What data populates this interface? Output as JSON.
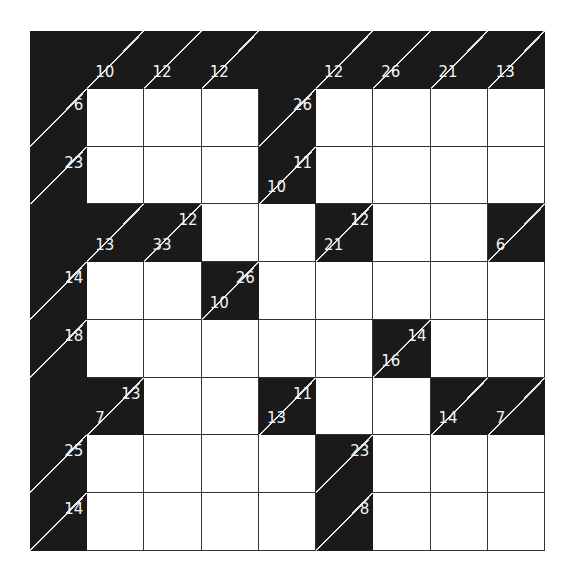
{
  "puzzle": {
    "type": "kakuro",
    "rows": 9,
    "cols": 9,
    "colors": {
      "black": "#1a1a1a",
      "white": "#ffffff",
      "clue_text": "#f2f2f2",
      "grid_line": "#333333"
    },
    "cells": [
      [
        {
          "t": "b"
        },
        {
          "t": "c",
          "d": "10"
        },
        {
          "t": "c",
          "d": "12"
        },
        {
          "t": "c",
          "d": "12"
        },
        {
          "t": "b"
        },
        {
          "t": "c",
          "d": "12"
        },
        {
          "t": "c",
          "d": "26"
        },
        {
          "t": "c",
          "d": "21"
        },
        {
          "t": "c",
          "d": "13"
        }
      ],
      [
        {
          "t": "c",
          "r": "6"
        },
        {
          "t": "w"
        },
        {
          "t": "w"
        },
        {
          "t": "w"
        },
        {
          "t": "c",
          "r": "26"
        },
        {
          "t": "w"
        },
        {
          "t": "w"
        },
        {
          "t": "w"
        },
        {
          "t": "w"
        }
      ],
      [
        {
          "t": "c",
          "r": "23"
        },
        {
          "t": "w"
        },
        {
          "t": "w"
        },
        {
          "t": "w"
        },
        {
          "t": "c",
          "r": "11",
          "d": "10"
        },
        {
          "t": "w"
        },
        {
          "t": "w"
        },
        {
          "t": "w"
        },
        {
          "t": "w"
        }
      ],
      [
        {
          "t": "b"
        },
        {
          "t": "c",
          "d": "13"
        },
        {
          "t": "c",
          "r": "12",
          "d": "33"
        },
        {
          "t": "w"
        },
        {
          "t": "w"
        },
        {
          "t": "c",
          "r": "12",
          "d": "21"
        },
        {
          "t": "w"
        },
        {
          "t": "w"
        },
        {
          "t": "c",
          "d": "6"
        }
      ],
      [
        {
          "t": "c",
          "r": "14"
        },
        {
          "t": "w"
        },
        {
          "t": "w"
        },
        {
          "t": "c",
          "r": "26",
          "d": "10"
        },
        {
          "t": "w"
        },
        {
          "t": "w"
        },
        {
          "t": "w"
        },
        {
          "t": "w"
        },
        {
          "t": "w"
        }
      ],
      [
        {
          "t": "c",
          "r": "18"
        },
        {
          "t": "w"
        },
        {
          "t": "w"
        },
        {
          "t": "w"
        },
        {
          "t": "w"
        },
        {
          "t": "w"
        },
        {
          "t": "c",
          "r": "14",
          "d": "16"
        },
        {
          "t": "w"
        },
        {
          "t": "w"
        }
      ],
      [
        {
          "t": "b"
        },
        {
          "t": "c",
          "r": "13",
          "d": "7"
        },
        {
          "t": "w"
        },
        {
          "t": "w"
        },
        {
          "t": "c",
          "r": "11",
          "d": "13"
        },
        {
          "t": "w"
        },
        {
          "t": "w"
        },
        {
          "t": "c",
          "d": "14"
        },
        {
          "t": "c",
          "d": "7"
        }
      ],
      [
        {
          "t": "c",
          "r": "25"
        },
        {
          "t": "w"
        },
        {
          "t": "w"
        },
        {
          "t": "w"
        },
        {
          "t": "w"
        },
        {
          "t": "c",
          "r": "23"
        },
        {
          "t": "w"
        },
        {
          "t": "w"
        },
        {
          "t": "w"
        }
      ],
      [
        {
          "t": "c",
          "r": "14"
        },
        {
          "t": "w"
        },
        {
          "t": "w"
        },
        {
          "t": "w"
        },
        {
          "t": "w"
        },
        {
          "t": "c",
          "r": "8"
        },
        {
          "t": "w"
        },
        {
          "t": "w"
        },
        {
          "t": "w"
        }
      ]
    ]
  }
}
